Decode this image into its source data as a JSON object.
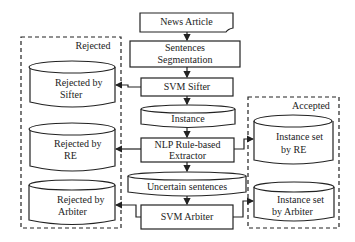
{
  "diagram": {
    "nodes": {
      "news_article": {
        "label": "News Article",
        "shape": "document"
      },
      "sentences_segmentation": {
        "line1": "Sentences",
        "line2": "Segmentation",
        "shape": "process"
      },
      "svm_sifter": {
        "label": "SVM Sifter",
        "shape": "process"
      },
      "instance": {
        "label": "Instance",
        "shape": "storage"
      },
      "nlp_extractor": {
        "line1": "NLP Rule-based",
        "line2": "Extractor",
        "shape": "process"
      },
      "uncertain_sentences": {
        "label": "Uncertain sentences",
        "shape": "storage"
      },
      "svm_arbiter": {
        "label": "SVM Arbiter",
        "shape": "process"
      }
    },
    "groups": {
      "rejected": {
        "title": "Rejected",
        "items": [
          {
            "line1": "Rejected by",
            "line2": "Sifter"
          },
          {
            "line1": "Rejected by",
            "line2": "RE"
          },
          {
            "line1": "Rejected by",
            "line2": "Arbiter"
          }
        ]
      },
      "accepted": {
        "title": "Accepted",
        "items": [
          {
            "line1": "Instance set",
            "line2": "by RE"
          },
          {
            "line1": "Instance set",
            "line2": "by Arbiter"
          }
        ]
      }
    },
    "edges": [
      [
        "News Article",
        "Sentences Segmentation"
      ],
      [
        "Sentences Segmentation",
        "SVM Sifter"
      ],
      [
        "SVM Sifter",
        "Instance"
      ],
      [
        "Instance",
        "NLP Rule-based Extractor"
      ],
      [
        "NLP Rule-based Extractor",
        "Uncertain sentences"
      ],
      [
        "Uncertain sentences",
        "SVM Arbiter"
      ],
      [
        "SVM Sifter",
        "Rejected by Sifter"
      ],
      [
        "NLP Rule-based Extractor",
        "Rejected by RE"
      ],
      [
        "SVM Arbiter",
        "Rejected by Arbiter"
      ],
      [
        "NLP Rule-based Extractor",
        "Instance set by RE"
      ],
      [
        "SVM Arbiter",
        "Instance set by Arbiter"
      ]
    ],
    "colors": {
      "stroke": "#222222",
      "background": "#ffffff"
    }
  }
}
